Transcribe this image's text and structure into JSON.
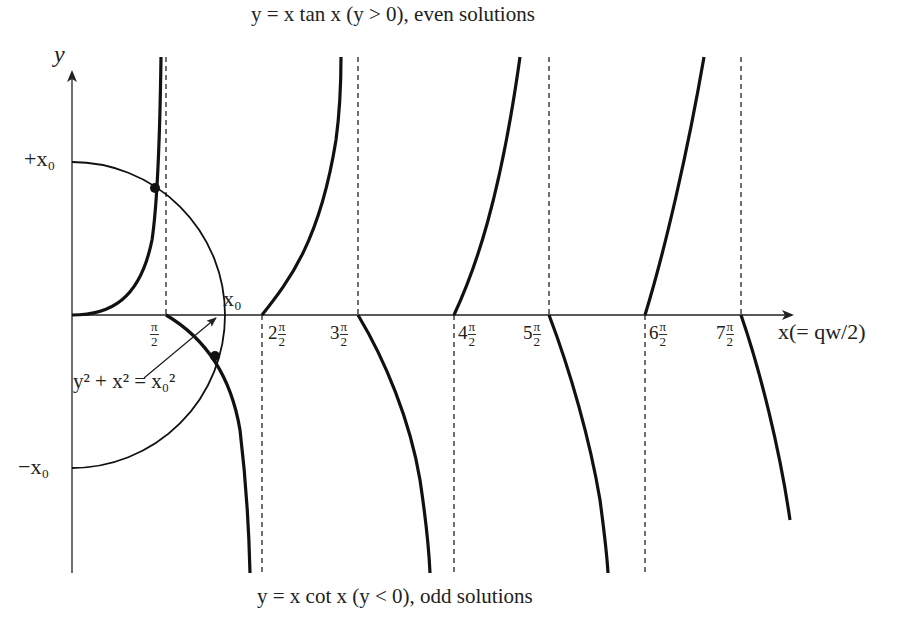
{
  "diagram": {
    "title_top": "y = x tan x (y > 0), even solutions",
    "title_bottom": "y = x cot x (y < 0), odd solutions",
    "y_axis_label": "y",
    "x_axis_label": "x(= qw/2)",
    "y_labels": {
      "plus": "+x₀",
      "minus": "−x₀"
    },
    "x0_label": "x₀",
    "circle_eq": "y² + x² = x₀²",
    "ticks": [
      {
        "coef": "",
        "num": "π",
        "den": "2"
      },
      {
        "coef": "2",
        "num": "π",
        "den": "2"
      },
      {
        "coef": "3",
        "num": "π",
        "den": "2"
      },
      {
        "coef": "4",
        "num": "π",
        "den": "2"
      },
      {
        "coef": "5",
        "num": "π",
        "den": "2"
      },
      {
        "coef": "6",
        "num": "π",
        "den": "2"
      },
      {
        "coef": "7",
        "num": "π",
        "den": "2"
      }
    ],
    "colors": {
      "curve": "#111111",
      "axis": "#222222",
      "text": "#222222",
      "background": "#ffffff"
    }
  }
}
